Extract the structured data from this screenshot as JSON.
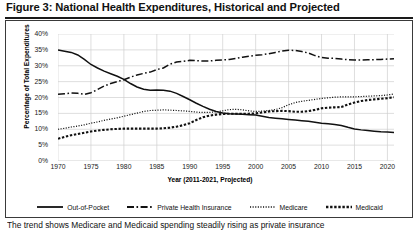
{
  "figure": {
    "title": "Figure 3: National Health Expenditures, Historical and Projected",
    "caption": "The trend shows Medicare and Medicaid spending steadily rising as private insurance"
  },
  "chart_data": {
    "type": "line",
    "title": "National Health Expenditures, Historical and Projected",
    "xlabel": "Year (2011-2021, Projected)",
    "ylabel": "Percentage of Total Expenditures",
    "xlim": [
      1970,
      2021
    ],
    "ylim": [
      0,
      40
    ],
    "ytick_labels": [
      "0%",
      "5%",
      "10%",
      "15%",
      "20%",
      "25%",
      "30%",
      "35%",
      "40%"
    ],
    "ytick_values": [
      0,
      5,
      10,
      15,
      20,
      25,
      30,
      35,
      40
    ],
    "xtick_labels": [
      "1970",
      "1975",
      "1980",
      "1985",
      "1990",
      "1995",
      "2000",
      "2005",
      "2010",
      "2015",
      "2020"
    ],
    "xtick_values": [
      1970,
      1975,
      1980,
      1985,
      1990,
      1995,
      2000,
      2005,
      2010,
      2015,
      2020
    ],
    "grid": true,
    "legend_position": "bottom",
    "x": [
      1970,
      1971,
      1972,
      1973,
      1974,
      1975,
      1976,
      1977,
      1978,
      1979,
      1980,
      1981,
      1982,
      1983,
      1984,
      1985,
      1986,
      1987,
      1988,
      1989,
      1990,
      1991,
      1992,
      1993,
      1994,
      1995,
      1996,
      1997,
      1998,
      1999,
      2000,
      2001,
      2002,
      2003,
      2004,
      2005,
      2006,
      2007,
      2008,
      2009,
      2010,
      2011,
      2012,
      2013,
      2014,
      2015,
      2016,
      2017,
      2018,
      2019,
      2020,
      2021
    ],
    "series": [
      {
        "name": "Out-of-Pocket",
        "style": "solid",
        "values": [
          35.0,
          34.6,
          34.2,
          33.4,
          32.0,
          30.4,
          29.3,
          28.3,
          27.5,
          26.7,
          25.7,
          24.4,
          23.3,
          22.6,
          22.3,
          22.4,
          22.3,
          22.0,
          21.3,
          20.3,
          19.3,
          18.2,
          17.2,
          16.3,
          15.6,
          15.1,
          14.9,
          14.8,
          14.7,
          14.6,
          14.5,
          14.1,
          13.7,
          13.5,
          13.3,
          13.1,
          12.9,
          12.7,
          12.5,
          12.2,
          11.9,
          11.7,
          11.5,
          11.2,
          10.6,
          10.1,
          9.8,
          9.6,
          9.4,
          9.2,
          9.1,
          9.0
        ]
      },
      {
        "name": "Private Health Insurance",
        "style": "dash-dot",
        "values": [
          21.0,
          21.2,
          21.4,
          21.3,
          21.0,
          21.5,
          22.5,
          23.6,
          24.4,
          25.0,
          25.6,
          26.4,
          27.1,
          27.6,
          28.0,
          28.8,
          29.3,
          30.5,
          31.2,
          31.4,
          31.7,
          31.6,
          31.5,
          31.5,
          31.7,
          31.8,
          32.0,
          32.3,
          32.7,
          33.0,
          33.3,
          33.5,
          33.8,
          34.2,
          34.6,
          34.9,
          34.8,
          34.5,
          34.0,
          33.2,
          32.6,
          32.4,
          32.3,
          32.1,
          31.9,
          31.8,
          31.8,
          31.9,
          31.9,
          32.0,
          32.1,
          32.2
        ]
      },
      {
        "name": "Medicare",
        "style": "dotted-fine",
        "values": [
          10.0,
          10.3,
          10.7,
          11.0,
          11.4,
          11.9,
          12.3,
          12.8,
          13.2,
          13.6,
          14.1,
          14.6,
          15.1,
          15.6,
          15.9,
          16.0,
          16.1,
          16.0,
          15.9,
          15.8,
          15.6,
          15.4,
          15.3,
          15.3,
          15.5,
          15.8,
          16.2,
          16.3,
          16.1,
          15.8,
          15.6,
          15.7,
          15.9,
          16.2,
          16.8,
          17.7,
          18.4,
          18.8,
          19.1,
          19.4,
          19.7,
          19.9,
          20.1,
          20.2,
          20.2,
          20.2,
          20.3,
          20.4,
          20.5,
          20.6,
          20.8,
          21.1
        ]
      },
      {
        "name": "Medicaid",
        "style": "dotted-bold",
        "values": [
          7.0,
          7.6,
          8.1,
          8.5,
          8.9,
          9.3,
          9.6,
          9.8,
          10.0,
          10.1,
          10.2,
          10.2,
          10.2,
          10.2,
          10.2,
          10.2,
          10.3,
          10.5,
          10.8,
          11.3,
          11.9,
          12.9,
          13.8,
          14.3,
          14.6,
          14.8,
          14.9,
          14.9,
          14.9,
          14.9,
          15.0,
          15.3,
          15.6,
          15.7,
          15.8,
          15.7,
          15.5,
          15.5,
          15.7,
          16.1,
          16.6,
          16.8,
          16.9,
          17.0,
          17.8,
          18.4,
          18.9,
          19.2,
          19.4,
          19.6,
          19.8,
          20.1
        ]
      }
    ]
  },
  "legend": [
    {
      "label": "Out-of-Pocket",
      "style": "solid"
    },
    {
      "label": "Private Health Insurance",
      "style": "dash-dot"
    },
    {
      "label": "Medicare",
      "style": "dotted-fine"
    },
    {
      "label": "Medicaid",
      "style": "dotted-bold"
    }
  ]
}
